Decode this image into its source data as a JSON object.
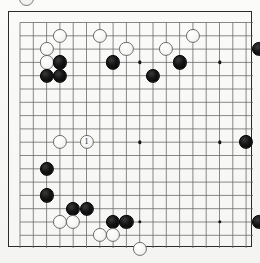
{
  "diagram": {
    "kind": "go-board-diagram",
    "board_size": 19,
    "top_fragment_icon": "white-stone-fragment",
    "move_marker_label": "1",
    "colors": {
      "black_stone": "#101010",
      "white_stone": "#f8f8f6",
      "white_stone_outline": "#6d6d6d",
      "grid_line": "#6a6a6a",
      "board_border": "#2b2b2b",
      "paper_background": "#f7f7f5"
    },
    "geometry": {
      "origin_x": 19.0,
      "origin_y": 21.5,
      "spacing": 13.3,
      "stone_diameter": 14.2,
      "lines": 19
    },
    "hoshi_points": [
      {
        "col": 3,
        "row": 3
      },
      {
        "col": 9,
        "row": 3
      },
      {
        "col": 15,
        "row": 3
      },
      {
        "col": 3,
        "row": 9
      },
      {
        "col": 9,
        "row": 9
      },
      {
        "col": 15,
        "row": 9
      },
      {
        "col": 3,
        "row": 15
      },
      {
        "col": 9,
        "row": 15
      },
      {
        "col": 15,
        "row": 15
      }
    ],
    "stones": [
      {
        "color": "white",
        "col": 3,
        "row": 1,
        "label": ""
      },
      {
        "color": "white",
        "col": 6,
        "row": 1,
        "label": ""
      },
      {
        "color": "white",
        "col": 13,
        "row": 1,
        "label": ""
      },
      {
        "color": "white",
        "col": 2,
        "row": 2,
        "label": ""
      },
      {
        "color": "white",
        "col": 8,
        "row": 2,
        "label": ""
      },
      {
        "color": "white",
        "col": 11,
        "row": 2,
        "label": ""
      },
      {
        "color": "black",
        "col": 18,
        "row": 2,
        "label": ""
      },
      {
        "color": "white",
        "col": 2,
        "row": 3,
        "label": ""
      },
      {
        "color": "black",
        "col": 3,
        "row": 3,
        "label": ""
      },
      {
        "color": "black",
        "col": 7,
        "row": 3,
        "label": ""
      },
      {
        "color": "black",
        "col": 12,
        "row": 3,
        "label": ""
      },
      {
        "color": "black",
        "col": 2,
        "row": 4,
        "label": ""
      },
      {
        "color": "black",
        "col": 3,
        "row": 4,
        "label": ""
      },
      {
        "color": "black",
        "col": 10,
        "row": 4,
        "label": ""
      },
      {
        "color": "white",
        "col": 3,
        "row": 9,
        "label": ""
      },
      {
        "color": "white",
        "col": 5,
        "row": 9,
        "label": "1"
      },
      {
        "color": "black",
        "col": 17,
        "row": 9,
        "label": ""
      },
      {
        "color": "white",
        "col": 19,
        "row": 9,
        "label": ""
      },
      {
        "color": "black",
        "col": 2,
        "row": 11,
        "label": ""
      },
      {
        "color": "black",
        "col": 2,
        "row": 13,
        "label": ""
      },
      {
        "color": "black",
        "col": 4,
        "row": 14,
        "label": ""
      },
      {
        "color": "black",
        "col": 5,
        "row": 14,
        "label": ""
      },
      {
        "color": "white",
        "col": 3,
        "row": 15,
        "label": ""
      },
      {
        "color": "white",
        "col": 4,
        "row": 15,
        "label": ""
      },
      {
        "color": "black",
        "col": 7,
        "row": 15,
        "label": ""
      },
      {
        "color": "black",
        "col": 8,
        "row": 15,
        "label": ""
      },
      {
        "color": "black",
        "col": 18,
        "row": 15,
        "label": ""
      },
      {
        "color": "white",
        "col": 6,
        "row": 16,
        "label": ""
      },
      {
        "color": "white",
        "col": 7,
        "row": 16,
        "label": ""
      },
      {
        "color": "white",
        "col": 9,
        "row": 17,
        "label": ""
      }
    ]
  }
}
